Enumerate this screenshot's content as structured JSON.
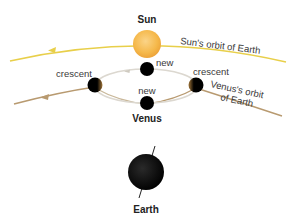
{
  "diagram": {
    "labels": {
      "sun": "Sun",
      "sun_orbit": "Sun's orbit of Earth",
      "venus_orbit_line1": "Venus's orbit",
      "venus_orbit_line2": "of Earth",
      "venus": "Venus",
      "earth": "Earth",
      "phase_new_top": "new",
      "phase_new_bottom": "new",
      "phase_crescent_left": "crescent",
      "phase_crescent_right": "crescent"
    },
    "colors": {
      "sun_fill": "#f5b84a",
      "sun_orbit": "#e8cf4a",
      "venus_orbit": "#b89a70",
      "epicycle": "#d8d4cc",
      "planet": "#000000",
      "text": "#3a3a3a"
    },
    "elements": [
      {
        "name": "sun",
        "shape": "circle"
      },
      {
        "name": "earth",
        "shape": "circle",
        "has_axis": true
      },
      {
        "name": "venus-new-top",
        "phase": "new"
      },
      {
        "name": "venus-new-bottom",
        "phase": "new"
      },
      {
        "name": "venus-crescent-left",
        "phase": "crescent"
      },
      {
        "name": "venus-crescent-right",
        "phase": "crescent"
      }
    ]
  }
}
